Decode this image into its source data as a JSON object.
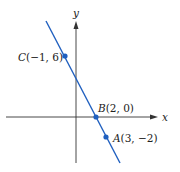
{
  "figure": {
    "axes": {
      "x_label": "x",
      "y_label": "y"
    },
    "line": {
      "color": "#1f5fbf"
    },
    "points": [
      {
        "name": "C",
        "coords": "(−1, 6)",
        "x": -1,
        "y": 6
      },
      {
        "name": "B",
        "coords": "(2, 0)",
        "x": 2,
        "y": 0
      },
      {
        "name": "A",
        "coords": "(3, −2)",
        "x": 3,
        "y": -2
      }
    ]
  }
}
